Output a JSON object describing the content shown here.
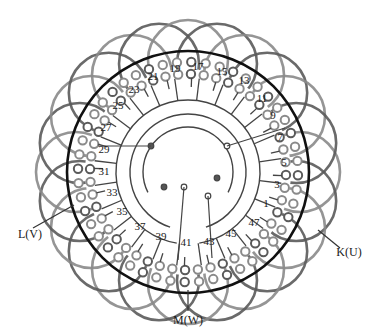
{
  "diagram": {
    "center": [
      188,
      172
    ],
    "colors": {
      "coil": "#5a5a5a",
      "coil_light": "#8a8a8a",
      "rotor_circle": "#111111",
      "wire": "#444444",
      "text": "#1a1a1a"
    },
    "slot_labels": [
      {
        "text": "17",
        "x": 198,
        "y": 66
      },
      {
        "text": "19",
        "x": 175,
        "y": 68
      },
      {
        "text": "21",
        "x": 153,
        "y": 76
      },
      {
        "text": "23",
        "x": 134,
        "y": 89
      },
      {
        "text": "25",
        "x": 118,
        "y": 105
      },
      {
        "text": "27",
        "x": 106,
        "y": 127
      },
      {
        "text": "29",
        "x": 104,
        "y": 149
      },
      {
        "text": "31",
        "x": 104,
        "y": 171
      },
      {
        "text": "33",
        "x": 112,
        "y": 192
      },
      {
        "text": "35",
        "x": 122,
        "y": 211
      },
      {
        "text": "37",
        "x": 140,
        "y": 226
      },
      {
        "text": "39",
        "x": 161,
        "y": 236
      },
      {
        "text": "41",
        "x": 186,
        "y": 242
      },
      {
        "text": "43",
        "x": 209,
        "y": 241
      },
      {
        "text": "45",
        "x": 231,
        "y": 233
      },
      {
        "text": "47",
        "x": 254,
        "y": 222
      },
      {
        "text": "1",
        "x": 266,
        "y": 203
      },
      {
        "text": "3",
        "x": 277,
        "y": 184
      },
      {
        "text": "5",
        "x": 284,
        "y": 162
      },
      {
        "text": "7",
        "x": 280,
        "y": 137
      },
      {
        "text": "9",
        "x": 273,
        "y": 115
      },
      {
        "text": "11",
        "x": 262,
        "y": 98
      },
      {
        "text": "13",
        "x": 244,
        "y": 80
      },
      {
        "text": "15",
        "x": 222,
        "y": 71
      }
    ],
    "terminals": [
      {
        "id": "L",
        "text": "L(V)",
        "x": 30,
        "y": 234,
        "lead_from": [
          33,
          228
        ],
        "lead_to": [
          74,
          205
        ]
      },
      {
        "id": "M",
        "text": "M(W)",
        "x": 188,
        "y": 320,
        "lead_from": [
          188,
          311
        ],
        "lead_to": [
          188,
          290
        ]
      },
      {
        "id": "K",
        "text": "K(U)",
        "x": 349,
        "y": 252,
        "lead_from": [
          340,
          248
        ],
        "lead_to": [
          318,
          230
        ]
      }
    ],
    "inner_nodes": [
      {
        "x": 151,
        "y": 146,
        "filled": true
      },
      {
        "x": 227,
        "y": 146,
        "filled": false
      },
      {
        "x": 164,
        "y": 187,
        "filled": true
      },
      {
        "x": 184,
        "y": 187,
        "filled": false
      },
      {
        "x": 217,
        "y": 178,
        "filled": true
      },
      {
        "x": 208,
        "y": 196,
        "filled": false
      }
    ]
  }
}
